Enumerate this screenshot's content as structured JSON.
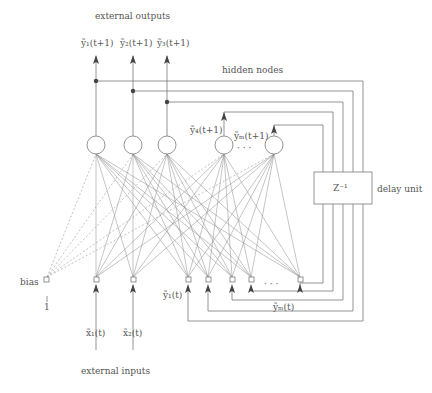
{
  "labels": {
    "external_outputs": "external outputs",
    "hidden_nodes": "hidden nodes",
    "delay_unit": "delay unit",
    "delay_operator": "Z⁻¹",
    "bias": "bias",
    "bias_value": "1",
    "external_inputs": "external inputs",
    "ellipsis_hidden": "· · ·",
    "ellipsis_inputs": "· · ·"
  },
  "outputs": [
    {
      "label": "ỹ₁(t+1)"
    },
    {
      "label": "ỹ₂(t+1)"
    },
    {
      "label": "ỹ₃(t+1)"
    }
  ],
  "hidden_outputs": [
    {
      "label": "ỹ₄(t+1)"
    },
    {
      "label": "ỹₘ(t+1)"
    }
  ],
  "inputs": [
    {
      "label": "x̃₁(t)"
    },
    {
      "label": "x̃₂(t)"
    }
  ],
  "feedback_inputs": [
    {
      "label": "ỹ₁(t)"
    },
    {
      "label": "ỹₘ(t)"
    }
  ],
  "colors": {
    "line": "#7a7a7a",
    "text": "#555555",
    "dot": "#444444"
  }
}
